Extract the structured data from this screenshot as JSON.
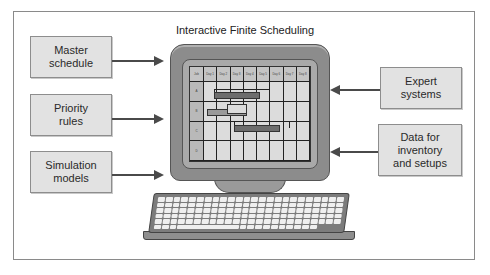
{
  "title": "Interactive Finite Scheduling",
  "inputs_left": [
    {
      "label": "Master\nschedule"
    },
    {
      "label": "Priority\nrules"
    },
    {
      "label": "Simulation\nmodels"
    }
  ],
  "inputs_right": [
    {
      "label": "Expert\nsystems"
    },
    {
      "label": "Data for\ninventory\nand setups"
    }
  ],
  "screen": {
    "header": [
      "Job",
      "Day 1",
      "Day 2",
      "Day 3",
      "Day 4",
      "Day 5",
      "Day 6",
      "Day 7",
      "Day 8"
    ],
    "rows": [
      "A",
      "B",
      "C",
      "D"
    ]
  },
  "colors": {
    "box_fill": "#e2e2e2",
    "arrow": "#4a4a4a",
    "monitor": "#8c8c8c",
    "frame_border": "#8a8a8a"
  }
}
